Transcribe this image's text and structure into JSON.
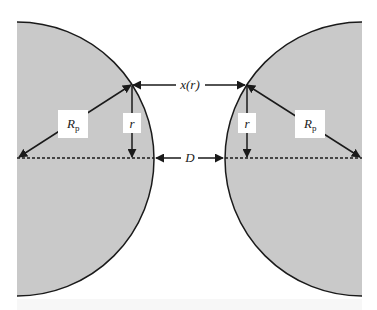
{
  "diagram": {
    "colors": {
      "particle_fill": "#c9c9c9",
      "outline": "#1a1a1a",
      "background": "#ffffff"
    },
    "labels": {
      "separation": "x(r)",
      "gap": "D",
      "radius_left": "R",
      "radius_left_sub": "p",
      "radius_right": "R",
      "radius_right_sub": "p",
      "r_left": "r",
      "r_right": "r"
    },
    "elements": [
      {
        "name": "left-particle",
        "shape": "circle-segment"
      },
      {
        "name": "right-particle",
        "shape": "circle-segment"
      },
      {
        "name": "centerline",
        "style": "dashed"
      },
      {
        "name": "x-r-arrows",
        "label": "x(r)"
      },
      {
        "name": "d-arrows",
        "label": "D"
      },
      {
        "name": "rp-arrows",
        "label": "Rp"
      },
      {
        "name": "r-arrows",
        "label": "r"
      }
    ]
  }
}
